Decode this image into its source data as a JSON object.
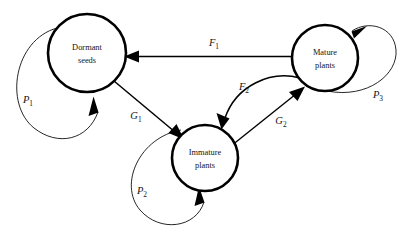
{
  "diagram": {
    "background_color": "#ffffff",
    "stroke_color": "#000000",
    "text_color": "#141414",
    "nodes": [
      {
        "id": "dormant-seeds",
        "label_line1": "Dormant",
        "label_line2": "seeds",
        "cx": 87,
        "cy": 53,
        "r": 39
      },
      {
        "id": "mature-plants",
        "label_line1": "Mature",
        "label_line2": "plants",
        "cx": 325,
        "cy": 58,
        "r": 33
      },
      {
        "id": "immature-plants",
        "label_line1": "Immature",
        "label_line2": "plants",
        "cx": 205,
        "cy": 158,
        "r": 33
      }
    ],
    "edges": [
      {
        "id": "F1",
        "letter": "F",
        "subscript": "1",
        "from": "mature-plants",
        "to": "dormant-seeds",
        "kind": "straight",
        "label_x": 214,
        "label_y": 44
      },
      {
        "id": "F2",
        "letter": "F",
        "subscript": "2",
        "from": "mature-plants",
        "to": "immature-plants",
        "kind": "curved",
        "label_x": 244,
        "label_y": 88
      },
      {
        "id": "G1",
        "letter": "G",
        "subscript": "1",
        "from": "dormant-seeds",
        "to": "immature-plants",
        "kind": "straight",
        "label_x": 136,
        "label_y": 117
      },
      {
        "id": "G2",
        "letter": "G",
        "subscript": "2",
        "from": "immature-plants",
        "to": "mature-plants",
        "kind": "straight",
        "label_x": 281,
        "label_y": 122
      }
    ],
    "self_loops": [
      {
        "id": "P1",
        "letter": "P",
        "subscript": "1",
        "node": "dormant-seeds",
        "label_x": 28,
        "label_y": 101
      },
      {
        "id": "P2",
        "letter": "P",
        "subscript": "2",
        "node": "immature-plants",
        "label_x": 142,
        "label_y": 192
      },
      {
        "id": "P3",
        "letter": "P",
        "subscript": "3",
        "node": "mature-plants",
        "label_x": 378,
        "label_y": 96
      }
    ]
  }
}
